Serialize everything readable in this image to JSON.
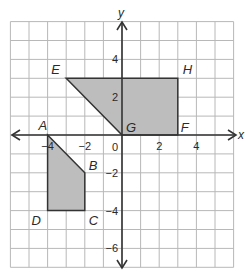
{
  "diagram": {
    "type": "coordinate-plane",
    "grid": {
      "x_min": -6,
      "x_max": 6,
      "y_min": -7,
      "y_max": 6,
      "step": 1
    },
    "axes": {
      "x_label": "x",
      "y_label": "y",
      "origin_label": "0"
    },
    "x_ticks": [
      {
        "value": -4,
        "label": "−4"
      },
      {
        "value": -2,
        "label": "−2"
      },
      {
        "value": 2,
        "label": "2"
      },
      {
        "value": 4,
        "label": "4"
      }
    ],
    "y_ticks": [
      {
        "value": 4,
        "label": "4"
      },
      {
        "value": 2,
        "label": "2"
      },
      {
        "value": -2,
        "label": "−2"
      },
      {
        "value": -4,
        "label": "−4"
      },
      {
        "value": -6,
        "label": "−6"
      }
    ],
    "polygons": [
      {
        "name": "ABCD",
        "fill": "#bdbdbd",
        "vertices": [
          {
            "label": "A",
            "x": -4,
            "y": 0
          },
          {
            "label": "B",
            "x": -2,
            "y": -2
          },
          {
            "label": "C",
            "x": -2,
            "y": -4
          },
          {
            "label": "D",
            "x": -4,
            "y": -4
          }
        ]
      },
      {
        "name": "EHFG",
        "fill": "#bdbdbd",
        "vertices": [
          {
            "label": "E",
            "x": -3,
            "y": 3
          },
          {
            "label": "H",
            "x": 3,
            "y": 3
          },
          {
            "label": "F",
            "x": 3,
            "y": 0
          },
          {
            "label": "G",
            "x": 0,
            "y": 0
          }
        ]
      }
    ],
    "colors": {
      "grid": "#b8b8b8",
      "axis": "#333333",
      "shape_fill": "#bdbdbd",
      "shape_stroke": "#333333"
    }
  }
}
